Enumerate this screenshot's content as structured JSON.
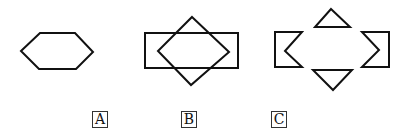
{
  "figure": {
    "stroke_color": "#111111",
    "options": [
      {
        "label": "A",
        "description": "hexagon",
        "shapes": [
          {
            "type": "polygon",
            "points": "21,51 40,33 75,33 93,52 76,69 39,69"
          }
        ]
      },
      {
        "label": "B",
        "description": "rectangle overlapped by a diamond",
        "shapes": [
          {
            "type": "rect",
            "x": 145,
            "y": 33,
            "width": 93,
            "height": 35
          },
          {
            "type": "polygon",
            "points": "192,17 229,52 191,85 158,51"
          }
        ]
      },
      {
        "label": "C",
        "description": "four separated pieces: top triangle, bottom inverted triangle, left notched bracket, right notched bracket",
        "shapes": [
          {
            "type": "polygon",
            "points": "331,9 350,27 315,27"
          },
          {
            "type": "polygon",
            "points": "313,70 352,70 333,90"
          },
          {
            "type": "polygon",
            "points": "275,32 302,32 285,51 302,67 275,67"
          },
          {
            "type": "polygon",
            "points": "362,32 389,32 389,67 362,67 379,50"
          }
        ]
      }
    ]
  }
}
